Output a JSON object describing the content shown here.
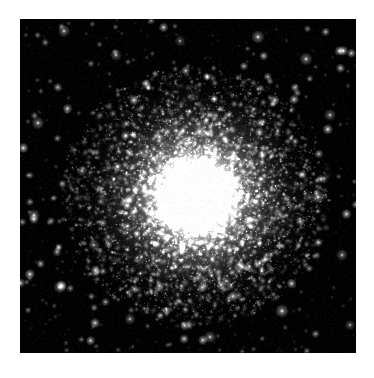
{
  "page": {
    "background_color": "#ffffff",
    "width": 374,
    "height": 378
  },
  "plate": {
    "name": "globular-cluster-image",
    "description": "Black-sky astronomical image of a globular star cluster",
    "sky_color": "#000000",
    "core_color": "#ffffff",
    "left": 20,
    "top": 19,
    "width": 336,
    "height": 334
  },
  "chart_data": {
    "type": "scatter",
    "title": "",
    "subtitle": "",
    "xlabel": "",
    "ylabel": "",
    "grid": false,
    "legend": null,
    "background": "#000000",
    "xlim": [
      0,
      336
    ],
    "ylim": [
      0,
      334
    ],
    "annotations": [],
    "cluster": {
      "label": "globular cluster",
      "center_x": 176,
      "center_y": 177,
      "core_radius": 26,
      "halo_radius": 96,
      "outer_radius": 132,
      "core_peak_brightness": 1.0,
      "member_star_count": 9000,
      "core_glow_stops": [
        {
          "offset": 0.0,
          "color": "#ffffff",
          "alpha": 1.0
        },
        {
          "offset": 0.12,
          "color": "#fbfbfb",
          "alpha": 0.96
        },
        {
          "offset": 0.26,
          "color": "#d8d8d8",
          "alpha": 0.78
        },
        {
          "offset": 0.44,
          "color": "#9a9a9a",
          "alpha": 0.48
        },
        {
          "offset": 0.64,
          "color": "#575757",
          "alpha": 0.24
        },
        {
          "offset": 0.82,
          "color": "#2a2a2a",
          "alpha": 0.09
        },
        {
          "offset": 1.0,
          "color": "#000000",
          "alpha": 0.0
        }
      ]
    },
    "field": {
      "label": "field stars",
      "star_count": 520,
      "color": "#ffffff",
      "magnitude_range": [
        0.12,
        1.0
      ],
      "size_range_px": [
        0.6,
        2.4
      ]
    },
    "bright_field_stars": [
      {
        "x": 44,
        "y": 12,
        "mag": 0.62
      },
      {
        "x": 96,
        "y": 36,
        "mag": 0.55
      },
      {
        "x": 160,
        "y": 22,
        "mag": 0.48
      },
      {
        "x": 238,
        "y": 18,
        "mag": 0.7
      },
      {
        "x": 286,
        "y": 40,
        "mag": 0.66
      },
      {
        "x": 310,
        "y": 96,
        "mag": 0.58
      },
      {
        "x": 18,
        "y": 104,
        "mag": 0.64
      },
      {
        "x": 62,
        "y": 152,
        "mag": 0.52
      },
      {
        "x": 14,
        "y": 196,
        "mag": 0.6
      },
      {
        "x": 298,
        "y": 178,
        "mag": 0.72
      },
      {
        "x": 322,
        "y": 236,
        "mag": 0.57
      },
      {
        "x": 40,
        "y": 268,
        "mag": 0.68
      },
      {
        "x": 110,
        "y": 300,
        "mag": 0.54
      },
      {
        "x": 190,
        "y": 318,
        "mag": 0.61
      },
      {
        "x": 262,
        "y": 292,
        "mag": 0.74
      },
      {
        "x": 206,
        "y": 262,
        "mag": 0.5
      },
      {
        "x": 330,
        "y": 306,
        "mag": 0.46
      },
      {
        "x": 74,
        "y": 226,
        "mag": 0.49
      }
    ]
  },
  "caption": {
    "text": ""
  }
}
